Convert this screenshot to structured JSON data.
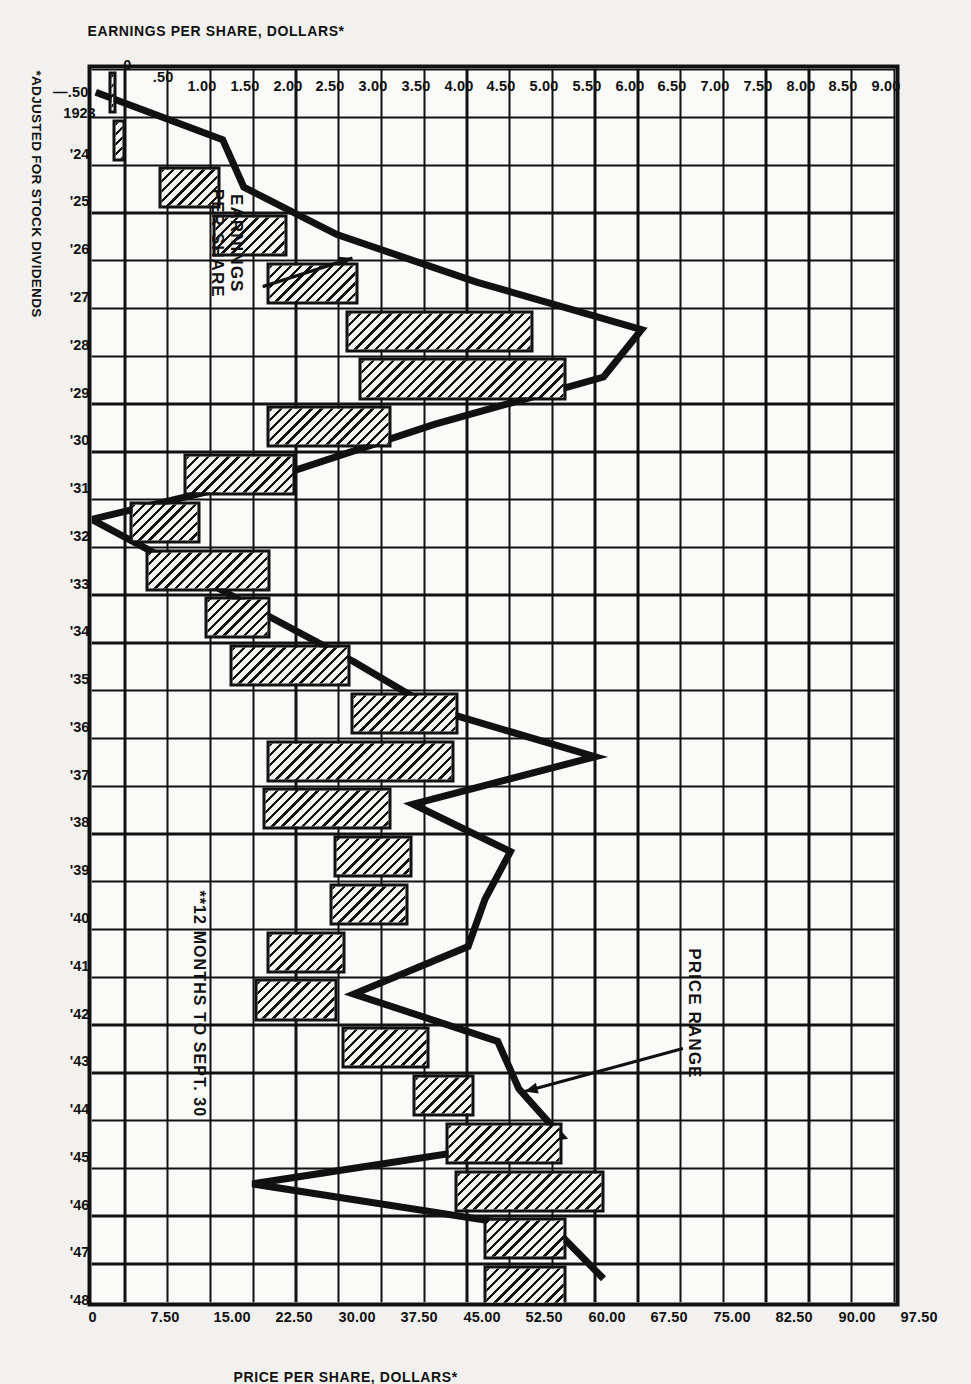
{
  "chart_data": {
    "type": "bar",
    "title": "",
    "subtitle": "",
    "xlabel": "",
    "ylabel": "EARNINGS PER SHARE, DOLLARS*",
    "ylabel_secondary": "PRICE PER SHARE, DOLLARS*",
    "grid": true,
    "legend_position": "inline-annotations",
    "categories": [
      "1923",
      "'24",
      "'25",
      "'26",
      "'27",
      "'28",
      "'29",
      "'30",
      "'31",
      "'32",
      "'33",
      "'34",
      "'35",
      "'36",
      "'37",
      "'38",
      "'39",
      "'40",
      "'41",
      "'42",
      "'43",
      "'44",
      "'45",
      "'46",
      "'47",
      "'48"
    ],
    "x": [
      1923,
      1924,
      1925,
      1926,
      1927,
      1928,
      1929,
      1930,
      1931,
      1932,
      1933,
      1934,
      1935,
      1936,
      1937,
      1938,
      1939,
      1940,
      1941,
      1942,
      1943,
      1944,
      1945,
      1946,
      1947,
      1948
    ],
    "ylim_left": [
      -0.5,
      9.0
    ],
    "ylim_right": [
      0,
      97.5
    ],
    "yticks_left": [
      "-.50",
      "0",
      ".50",
      "1.00",
      "1.50",
      "2.00",
      "2.50",
      "3.00",
      "3.50",
      "4.00",
      "4.50",
      "5.00",
      "5.50",
      "6.00",
      "6.50",
      "7.00",
      "7.50",
      "8.00",
      "8.50",
      "9.00"
    ],
    "yticks_right": [
      "0",
      "7.50",
      "15.00",
      "22.50",
      "30.00",
      "37.50",
      "45.00",
      "52.50",
      "60.00",
      "67.50",
      "75.00",
      "82.50",
      "90.00",
      "97.50"
    ],
    "series": [
      {
        "name": "PRICE RANGE",
        "type": "range-bar",
        "axis": "right",
        "unit": "dollars per share",
        "low": [
          3.0,
          3.5,
          9.0,
          15.5,
          22.0,
          31.5,
          33.0,
          22.0,
          12.0,
          5.5,
          7.5,
          14.5,
          17.5,
          32.0,
          22.0,
          21.5,
          30.0,
          29.5,
          22.0,
          20.5,
          31.0,
          39.5,
          43.5,
          44.5,
          48.0,
          48.0
        ],
        "high": [
          4.0,
          5.0,
          16.5,
          24.5,
          33.0,
          54.0,
          58.0,
          37.0,
          25.5,
          14.0,
          22.5,
          22.5,
          32.0,
          45.0,
          44.5,
          37.0,
          39.5,
          39.0,
          31.5,
          30.5,
          41.5,
          47.0,
          57.5,
          62.5,
          58.0,
          58.0
        ]
      },
      {
        "name": "EARNINGS PER SHARE",
        "type": "line",
        "axis": "left",
        "unit": "dollars per share",
        "values": [
          -0.45,
          1.05,
          1.3,
          2.4,
          4.05,
          6.0,
          5.55,
          3.55,
          1.85,
          -0.5,
          0.55,
          1.55,
          2.6,
          3.55,
          5.45,
          3.3,
          4.45,
          4.15,
          3.95,
          2.6,
          4.3,
          4.55,
          5.05,
          1.4,
          5.0,
          5.55
        ]
      }
    ],
    "annotations": [
      {
        "id": "price-range-annotation",
        "text_lines": [
          "PRICE RANGE"
        ],
        "points_to": "'44 price bar"
      },
      {
        "id": "earnings-annotation",
        "text_lines": [
          "EARNINGS",
          "PER SHARE"
        ],
        "points_to": "'27-'28 earnings line"
      },
      {
        "id": "twelve-months-note",
        "text": "**12 MONTHS TO SEPT. 30"
      }
    ],
    "footnotes": [
      "*ADJUSTED FOR STOCK DIVIDENDS"
    ],
    "colors": {
      "ink": "#111111",
      "paper": "#f2f1ef",
      "plot_bg": "#fafaf8",
      "hatch": "#111111"
    }
  },
  "axes": {
    "left": {
      "title": "EARNINGS PER SHARE, DOLLARS*",
      "ticks": [
        {
          "label": "9.00",
          "value": 9.0
        },
        {
          "label": "8.50",
          "value": 8.5
        },
        {
          "label": "8.00",
          "value": 8.0
        },
        {
          "label": "7.50",
          "value": 7.5
        },
        {
          "label": "7.00",
          "value": 7.0
        },
        {
          "label": "6.50",
          "value": 6.5
        },
        {
          "label": "6.00",
          "value": 6.0
        },
        {
          "label": "5.50",
          "value": 5.5
        },
        {
          "label": "5.00",
          "value": 5.0
        },
        {
          "label": "4.50",
          "value": 4.5
        },
        {
          "label": "4.00",
          "value": 4.0
        },
        {
          "label": "3.50",
          "value": 3.5
        },
        {
          "label": "3.00",
          "value": 3.0
        },
        {
          "label": "2.50",
          "value": 2.5
        },
        {
          "label": "2.00",
          "value": 2.0
        },
        {
          "label": "1.50",
          "value": 1.5
        },
        {
          "label": "1.00",
          "value": 1.0
        },
        {
          "label": ".50",
          "value": 0.5
        },
        {
          "label": "0",
          "value": 0
        },
        {
          "label": "—.50",
          "value": -0.5
        }
      ]
    },
    "right": {
      "title": "PRICE PER SHARE, DOLLARS*",
      "ticks": [
        {
          "label": "97.50",
          "value": 97.5
        },
        {
          "label": "90.00",
          "value": 90.0
        },
        {
          "label": "82.50",
          "value": 82.5
        },
        {
          "label": "75.00",
          "value": 75.0
        },
        {
          "label": "67.50",
          "value": 67.5
        },
        {
          "label": "60.00",
          "value": 60.0
        },
        {
          "label": "52.50",
          "value": 52.5
        },
        {
          "label": "45.00",
          "value": 45.0
        },
        {
          "label": "37.50",
          "value": 37.5
        },
        {
          "label": "30.00",
          "value": 30.0
        },
        {
          "label": "22.50",
          "value": 22.5
        },
        {
          "label": "15.00",
          "value": 15.0
        },
        {
          "label": "7.50",
          "value": 7.5
        },
        {
          "label": "0",
          "value": 0
        }
      ]
    }
  },
  "labels": {
    "price_range": "PRICE RANGE",
    "earnings_line1": "EARNINGS",
    "earnings_line2": "PER SHARE",
    "twelve_months": "**12 MONTHS TO SEPT. 30",
    "footnote": "*ADJUSTED FOR STOCK DIVIDENDS"
  }
}
